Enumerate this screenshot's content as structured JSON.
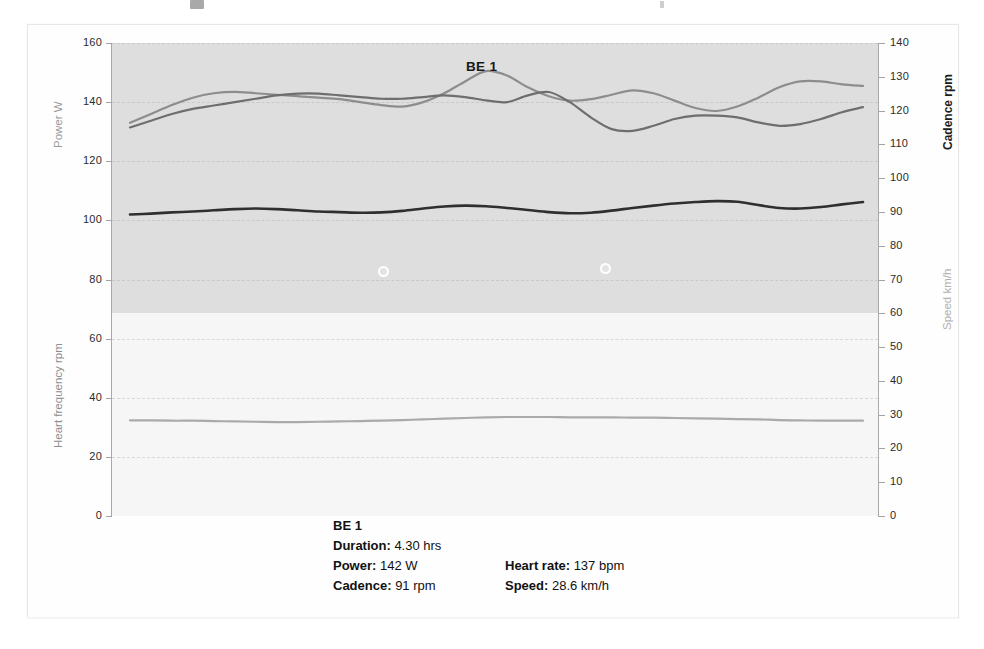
{
  "chart_data": {
    "type": "line",
    "title": "BE 1",
    "xlabel": "",
    "grid": true,
    "legend_position": "below-plot",
    "axes": {
      "left": {
        "titles": [
          "Power  W",
          "Heart frequency rpm"
        ],
        "min": 0,
        "max": 160,
        "step": 20,
        "ticks": [
          "0",
          "20",
          "40",
          "60",
          "80",
          "100",
          "120",
          "140",
          "160"
        ]
      },
      "right": {
        "titles": [
          "Cadence rpm",
          "Speed  km/h"
        ],
        "min": 0,
        "max": 140,
        "step": 10,
        "ticks": [
          "0",
          "10",
          "20",
          "30",
          "40",
          "50",
          "60",
          "70",
          "80",
          "90",
          "100",
          "110",
          "120",
          "130",
          "140"
        ]
      }
    },
    "shaded_band": {
      "from_left_value": 69,
      "to_left_value": 160,
      "color": "#dedede"
    },
    "series": [
      {
        "name": "Power",
        "unit": "W",
        "axis": "left",
        "color": "#8d8d8d",
        "values": [
          133,
          136,
          139,
          141.5,
          143,
          143.5,
          143,
          142.5,
          142,
          141.5,
          141,
          140,
          139,
          138.5,
          140,
          143,
          147,
          150.5,
          149,
          145,
          142,
          140.5,
          141,
          142.5,
          144,
          143,
          140.5,
          138,
          137,
          138.5,
          141.5,
          145,
          147,
          147,
          146,
          145.5
        ]
      },
      {
        "name": "Cadence",
        "unit": "rpm",
        "axis": "right",
        "color": "#6e6e6e",
        "values": [
          115,
          117,
          119,
          120.5,
          121.5,
          122.5,
          123.5,
          124.5,
          125,
          125,
          124.5,
          124,
          123.5,
          123.5,
          124,
          124.5,
          124,
          123,
          122.5,
          124.5,
          125.5,
          122.5,
          118,
          114.5,
          114,
          115.5,
          117.5,
          118.5,
          118.5,
          118,
          116.5,
          115.5,
          116,
          117.5,
          119.5,
          121
        ]
      },
      {
        "name": "Heart rate",
        "unit": "bpm",
        "axis": "left",
        "color": "#2f2f2f",
        "values": [
          102,
          102.3,
          102.7,
          103,
          103.4,
          103.8,
          104,
          103.8,
          103.4,
          103,
          102.8,
          102.6,
          102.7,
          103.2,
          104,
          104.7,
          105,
          104.8,
          104.2,
          103.5,
          102.8,
          102.4,
          102.6,
          103.3,
          104.2,
          105,
          105.7,
          106.2,
          106.5,
          106.3,
          105.2,
          104.2,
          104,
          104.5,
          105.4,
          106.2
        ]
      },
      {
        "name": "Speed",
        "unit": "km/h",
        "axis": "right",
        "color": "#9c9c9c",
        "values": [
          28.3,
          28.3,
          28.2,
          28.2,
          28.1,
          28.0,
          27.9,
          27.8,
          27.8,
          27.9,
          28.0,
          28.1,
          28.2,
          28.4,
          28.6,
          28.8,
          29.0,
          29.2,
          29.3,
          29.3,
          29.3,
          29.2,
          29.2,
          29.2,
          29.1,
          29.1,
          29.0,
          28.9,
          28.8,
          28.7,
          28.6,
          28.4,
          28.3,
          28.2,
          28.2,
          28.2
        ]
      }
    ],
    "point_markers": [
      {
        "x_frac": 0.345,
        "left_value": 83
      },
      {
        "x_frac": 0.648,
        "left_value": 84
      }
    ]
  },
  "summary": {
    "title": "BE 1",
    "rows": [
      {
        "label_a": "Duration:",
        "value_a": "4.30 hrs",
        "label_b": "",
        "value_b": ""
      },
      {
        "label_a": "Power:",
        "value_a": "142 W",
        "label_b": "Heart rate:",
        "value_b": "137 bpm"
      },
      {
        "label_a": "Cadence:",
        "value_a": "91 rpm",
        "label_b": "Speed:",
        "value_b": "28.6 km/h"
      }
    ]
  }
}
